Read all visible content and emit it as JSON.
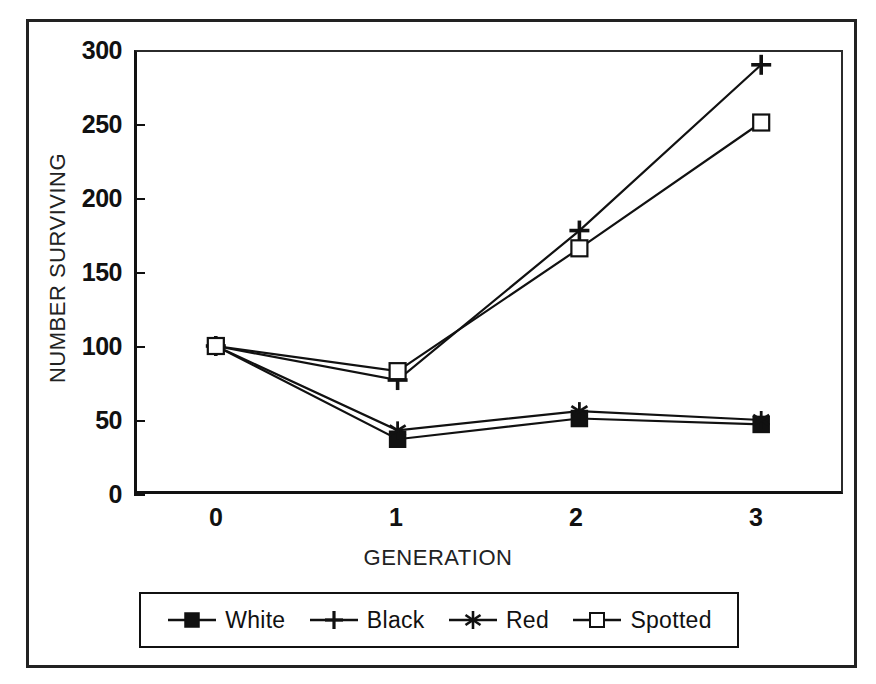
{
  "figure": {
    "background_color": "#ffffff",
    "line_color": "#111111",
    "frame_color": "#222222"
  },
  "chart_data": {
    "type": "line",
    "title": "",
    "xlabel": "GENERATION",
    "ylabel": "NUMBER SURVIVING",
    "x": [
      0,
      1,
      2,
      3
    ],
    "categories": [
      "0",
      "1",
      "2",
      "3"
    ],
    "xlim": [
      -0.45,
      3.45
    ],
    "ylim": [
      0,
      300
    ],
    "yticks": [
      0,
      50,
      100,
      150,
      200,
      250,
      300
    ],
    "ytick_labels": [
      "0",
      "50",
      "100",
      "150",
      "200",
      "250",
      "300"
    ],
    "xtick_labels": [
      "0",
      "1",
      "2",
      "3"
    ],
    "grid": false,
    "legend_position": "below-axes",
    "series": [
      {
        "name": "White",
        "marker": "filled-square",
        "color": "#111111",
        "values": [
          100,
          37,
          51,
          47
        ]
      },
      {
        "name": "Black",
        "marker": "plus",
        "color": "#111111",
        "values": [
          100,
          77,
          178,
          290
        ]
      },
      {
        "name": "Red",
        "marker": "asterisk",
        "color": "#111111",
        "values": [
          100,
          43,
          56,
          50
        ]
      },
      {
        "name": "Spotted",
        "marker": "open-square",
        "color": "#111111",
        "values": [
          100,
          83,
          166,
          251
        ]
      }
    ]
  },
  "legend": {
    "entries": [
      {
        "label": "White",
        "marker": "filled-square"
      },
      {
        "label": "Black",
        "marker": "plus"
      },
      {
        "label": "Red",
        "marker": "asterisk"
      },
      {
        "label": "Spotted",
        "marker": "open-square"
      }
    ]
  }
}
